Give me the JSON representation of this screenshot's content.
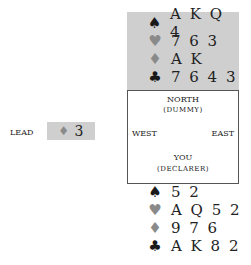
{
  "dummy": {
    "label": "NORTH",
    "sublabel": "(DUMMY)",
    "hand": [
      {
        "suit": "spades",
        "symbol": "♠",
        "cards": "A K Q 4"
      },
      {
        "suit": "hearts",
        "symbol": "♥",
        "cards": "7 6 3"
      },
      {
        "suit": "diamonds",
        "symbol": "♦",
        "cards": "A K"
      },
      {
        "suit": "clubs",
        "symbol": "♣",
        "cards": "7 6 4 3"
      }
    ]
  },
  "table": {
    "west": "WEST",
    "east": "EAST",
    "south": "YOU",
    "south_sub": "(DECLARER)"
  },
  "declarer": {
    "hand": [
      {
        "suit": "spades",
        "symbol": "♠",
        "cards": "5 2"
      },
      {
        "suit": "hearts",
        "symbol": "♥",
        "cards": "A Q 5 2"
      },
      {
        "suit": "diamonds",
        "symbol": "♦",
        "cards": "9 7 6"
      },
      {
        "suit": "clubs",
        "symbol": "♣",
        "cards": "A K 8 2"
      }
    ]
  },
  "lead": {
    "label": "LEAD",
    "symbol": "♦",
    "card": "3"
  },
  "colors": {
    "card_bg": "#cfcfcf",
    "red_suit": "#8a8a8a",
    "black_suit": "#1a1a1a"
  }
}
